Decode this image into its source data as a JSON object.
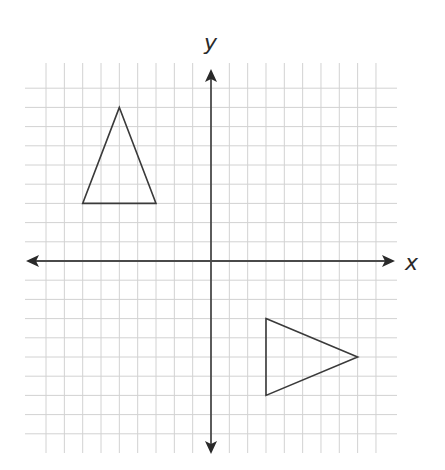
{
  "chart_data": {
    "type": "coordinate-grid",
    "title": "",
    "xlabel": "x",
    "ylabel": "y",
    "xlim": [
      -9,
      9
    ],
    "ylim": [
      -9,
      9
    ],
    "grid": true,
    "grid_step": 1,
    "axes_arrows": true,
    "shapes": [
      {
        "name": "triangle-1",
        "type": "triangle",
        "vertices": [
          [
            -5,
            8
          ],
          [
            -7,
            3
          ],
          [
            -3,
            3
          ]
        ]
      },
      {
        "name": "triangle-2",
        "type": "triangle",
        "vertices": [
          [
            3,
            -3
          ],
          [
            8,
            -5
          ],
          [
            3,
            -7
          ]
        ]
      }
    ]
  },
  "labels": {
    "x_axis": "x",
    "y_axis": "y"
  },
  "layout": {
    "origin_px": [
      211,
      261
    ],
    "unit_px_x": 18.33,
    "unit_px_y": 19.2,
    "grid_extent_px": {
      "left": 25,
      "right": 397,
      "top": 63,
      "bottom": 453
    },
    "colors": {
      "grid": "#d2d2d2",
      "axis": "#4a4a4a",
      "shape_stroke": "#3a3a3a",
      "background": "#ffffff"
    }
  }
}
